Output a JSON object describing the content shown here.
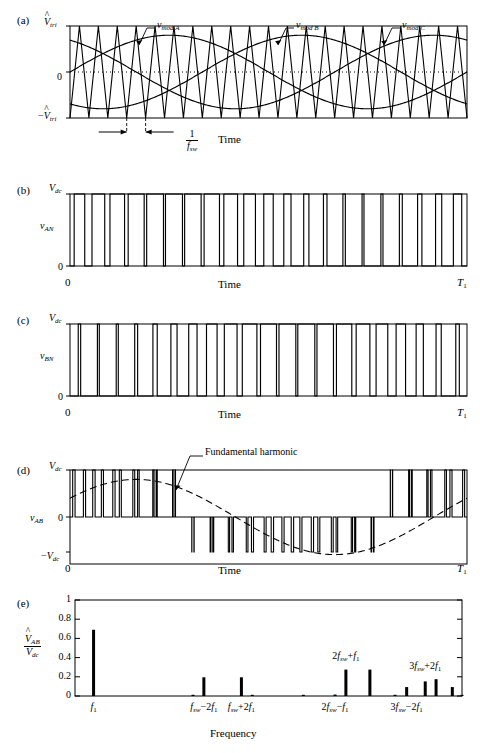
{
  "figure": {
    "caption_panels": [
      "(a)",
      "(b)",
      "(c)",
      "(d)",
      "(e)"
    ],
    "xlabel_time": "Time",
    "xlabel_frequency": "Frequency",
    "t_start": "0",
    "t_end": "T",
    "t_end_sub": "1"
  },
  "panel_a": {
    "tag": "(a)",
    "y_top": "V",
    "y_top_sub": "tri",
    "y_mid": "0",
    "y_bot_neg": "−V",
    "y_bot_sub": "tri",
    "xlabel": "Time",
    "traces": [
      {
        "name": "v",
        "sub": "mod A",
        "phase_deg": 0
      },
      {
        "name": "v",
        "sub": "mod B",
        "phase_deg": -120
      },
      {
        "name": "v",
        "sub": "mod C",
        "phase_deg": 120
      }
    ],
    "carrier": {
      "name": "triangular carrier",
      "cycles": 21,
      "amplitude": 1.0
    },
    "modulation_index": 0.8,
    "period_annotation": {
      "num": "1",
      "den": "f",
      "den_sub": "sw"
    }
  },
  "panel_b": {
    "tag": "(b)",
    "signal": "v",
    "signal_sub": "AN",
    "y_top": "V",
    "y_top_sub": "dc",
    "y_bot": "0",
    "xlabel": "Time",
    "x_start": "0",
    "x_end": "T",
    "x_end_sub": "1"
  },
  "panel_c": {
    "tag": "(c)",
    "signal": "v",
    "signal_sub": "BN",
    "y_top": "V",
    "y_top_sub": "dc",
    "y_bot": "0",
    "xlabel": "Time",
    "x_start": "0",
    "x_end": "T",
    "x_end_sub": "1"
  },
  "panel_d": {
    "tag": "(d)",
    "signal": "v",
    "signal_sub": "AB",
    "y_top": "V",
    "y_top_sub": "dc",
    "y_mid": "0",
    "y_bot": "−V",
    "y_bot_sub": "dc",
    "xlabel": "Time",
    "x_start": "0",
    "x_end": "T",
    "x_end_sub": "1",
    "annotation": "Fundamental harmonic"
  },
  "panel_e": {
    "tag": "(e)",
    "ylabel_num": "V",
    "ylabel_num_sub": "AB",
    "ylabel_den": "V",
    "ylabel_den_sub": "dc",
    "xlabel": "Frequency"
  },
  "chart_data": {
    "type": "bar",
    "title": "",
    "xlabel": "Frequency",
    "ylabel": "V̂_AB / V_dc",
    "ylim": [
      0,
      1
    ],
    "yticks": [
      0,
      0.2,
      0.4,
      0.6,
      0.8,
      1
    ],
    "ytick_labels": [
      "0",
      "0.2",
      "0.4",
      "0.6",
      "0.8",
      "1"
    ],
    "grid": false,
    "legend": false,
    "xtick_positions": [
      0.048,
      0.333,
      0.43,
      0.672,
      0.857
    ],
    "xtick_labels": [
      "f₁",
      "f_sw−2f₁",
      "f_sw+2f₁",
      "2f_sw−f₁",
      "3f_sw−2f₁"
    ],
    "annotations": [
      {
        "text": "2f_sw+f₁",
        "x": 0.7,
        "y": 0.33
      },
      {
        "text": "3f_sw+2f₁",
        "x": 0.905,
        "y": 0.23
      }
    ],
    "x": [
      0.048,
      0.305,
      0.333,
      0.43,
      0.458,
      0.59,
      0.672,
      0.7,
      0.762,
      0.827,
      0.857,
      0.905,
      0.933,
      0.975,
      1.0
    ],
    "values": [
      0.69,
      0.012,
      0.195,
      0.195,
      0.012,
      0.01,
      0.015,
      0.275,
      0.275,
      0.012,
      0.093,
      0.152,
      0.175,
      0.093,
      0.012
    ],
    "bar_color": "#000000",
    "bar_width_px": 3
  }
}
